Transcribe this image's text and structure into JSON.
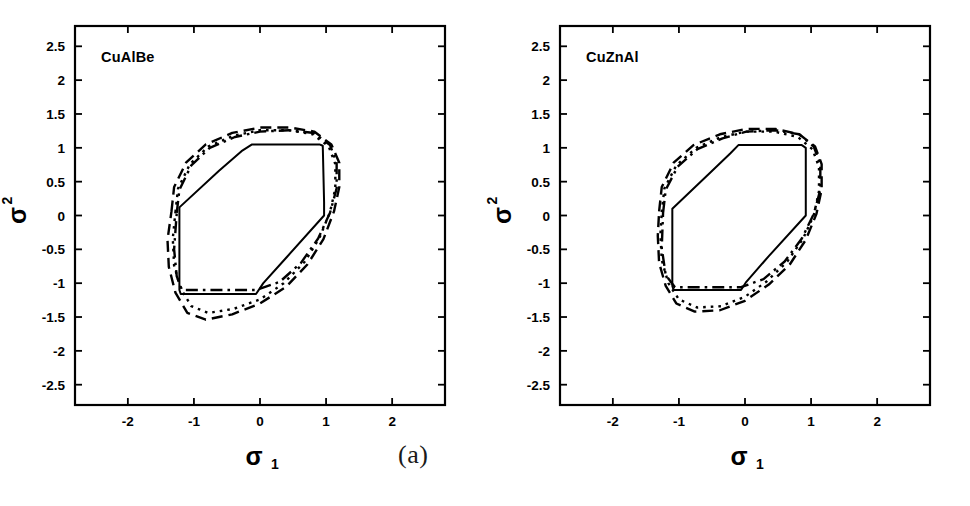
{
  "figure": {
    "panels": [
      {
        "caption": "(a)",
        "material_label": "CuAlBe",
        "xlabel_symbol": "σ",
        "xlabel_sub": "1",
        "ylabel_symbol": "σ",
        "ylabel_sub": "2"
      },
      {
        "caption": "(b)",
        "material_label": "CuZnAl",
        "xlabel_symbol": "σ",
        "xlabel_sub": "1",
        "ylabel_symbol": "σ",
        "ylabel_sub": "2"
      }
    ]
  },
  "chart_data": [
    {
      "type": "line",
      "title": "CuAlBe",
      "panel": "(a)",
      "xlabel": "σ1",
      "ylabel": "σ2",
      "xlim": [
        -2.8,
        2.8
      ],
      "ylim": [
        -2.8,
        2.8
      ],
      "xticks": [
        -2,
        -1,
        0,
        1,
        2
      ],
      "xticklabels": [
        "-2",
        "-1",
        "0",
        "1",
        "2"
      ],
      "yticks": [
        -2.5,
        -2,
        -1.5,
        -1,
        -0.5,
        0,
        0.5,
        1,
        1.5,
        2,
        2.5
      ],
      "yticklabels": [
        "-2.5",
        "-2",
        "-1.5",
        "-1",
        "-0.5",
        "0",
        "0.5",
        "1",
        "1.5",
        "2",
        "2.5"
      ],
      "grid": false,
      "legend": "none",
      "series": [
        {
          "name": "solid-yield-surface",
          "style": "solid",
          "closed": true,
          "points": [
            [
              -1.22,
              0.0
            ],
            [
              -1.22,
              0.12
            ],
            [
              -0.62,
              0.66
            ],
            [
              -0.28,
              0.95
            ],
            [
              -0.12,
              1.05
            ],
            [
              0.9,
              1.05
            ],
            [
              0.95,
              1.03
            ],
            [
              0.97,
              0.2
            ],
            [
              0.97,
              0.0
            ],
            [
              0.4,
              -0.62
            ],
            [
              0.05,
              -1.0
            ],
            [
              -0.06,
              -1.16
            ],
            [
              -1.2,
              -1.16
            ],
            [
              -1.22,
              -1.1
            ],
            [
              -1.22,
              0.0
            ]
          ]
        },
        {
          "name": "dashed-yield-surface",
          "style": "dashed",
          "closed": true,
          "points": [
            [
              -1.34,
              0.06
            ],
            [
              -1.3,
              0.42
            ],
            [
              -1.12,
              0.78
            ],
            [
              -0.82,
              1.05
            ],
            [
              -0.42,
              1.22
            ],
            [
              0.0,
              1.3
            ],
            [
              0.45,
              1.3
            ],
            [
              0.82,
              1.24
            ],
            [
              1.08,
              1.05
            ],
            [
              1.2,
              0.78
            ],
            [
              1.2,
              0.42
            ],
            [
              1.12,
              0.06
            ],
            [
              0.96,
              -0.35
            ],
            [
              0.72,
              -0.72
            ],
            [
              0.4,
              -1.05
            ],
            [
              0.0,
              -1.3
            ],
            [
              -0.42,
              -1.46
            ],
            [
              -0.82,
              -1.54
            ],
            [
              -1.1,
              -1.44
            ],
            [
              -1.28,
              -1.14
            ],
            [
              -1.38,
              -0.76
            ],
            [
              -1.4,
              -0.36
            ],
            [
              -1.34,
              0.06
            ]
          ]
        },
        {
          "name": "dotted-yield-surface",
          "style": "dotted",
          "closed": true,
          "points": [
            [
              -1.28,
              0.05
            ],
            [
              -1.24,
              0.4
            ],
            [
              -1.06,
              0.76
            ],
            [
              -0.78,
              1.02
            ],
            [
              -0.4,
              1.18
            ],
            [
              0.0,
              1.26
            ],
            [
              0.44,
              1.26
            ],
            [
              0.8,
              1.2
            ],
            [
              1.04,
              1.02
            ],
            [
              1.14,
              0.76
            ],
            [
              1.14,
              0.4
            ],
            [
              1.06,
              0.05
            ],
            [
              0.9,
              -0.33
            ],
            [
              0.68,
              -0.68
            ],
            [
              0.36,
              -1.0
            ],
            [
              0.0,
              -1.24
            ],
            [
              -0.4,
              -1.38
            ],
            [
              -0.78,
              -1.44
            ],
            [
              -1.04,
              -1.34
            ],
            [
              -1.2,
              -1.08
            ],
            [
              -1.3,
              -0.74
            ],
            [
              -1.32,
              -0.34
            ],
            [
              -1.28,
              0.05
            ]
          ]
        },
        {
          "name": "dashdot-yield-surface",
          "style": "dashdot",
          "closed": true,
          "points": [
            [
              -1.26,
              0.04
            ],
            [
              -1.22,
              0.38
            ],
            [
              -1.04,
              0.74
            ],
            [
              -0.76,
              1.0
            ],
            [
              -0.38,
              1.16
            ],
            [
              0.0,
              1.24
            ],
            [
              0.44,
              1.26
            ],
            [
              0.82,
              1.22
            ],
            [
              1.06,
              1.04
            ],
            [
              1.16,
              0.78
            ],
            [
              1.16,
              0.4
            ],
            [
              1.06,
              0.04
            ],
            [
              0.88,
              -0.34
            ],
            [
              0.62,
              -0.7
            ],
            [
              0.3,
              -0.98
            ],
            [
              -0.06,
              -1.1
            ],
            [
              -1.18,
              -1.1
            ],
            [
              -1.26,
              -0.9
            ],
            [
              -1.3,
              -0.5
            ],
            [
              -1.26,
              0.04
            ]
          ]
        }
      ]
    },
    {
      "type": "line",
      "title": "CuZnAl",
      "panel": "(b)",
      "xlabel": "σ1",
      "ylabel": "σ2",
      "xlim": [
        -2.8,
        2.8
      ],
      "ylim": [
        -2.8,
        2.8
      ],
      "xticks": [
        -2,
        -1,
        0,
        1,
        2
      ],
      "xticklabels": [
        "-2",
        "-1",
        "0",
        "1",
        "2"
      ],
      "yticks": [
        -2.5,
        -2,
        -1.5,
        -1,
        -0.5,
        0,
        0.5,
        1,
        1.5,
        2,
        2.5
      ],
      "yticklabels": [
        "-2.5",
        "-2",
        "-1.5",
        "-1",
        "-0.5",
        "0",
        "0.5",
        "1",
        "1.5",
        "2",
        "2.5"
      ],
      "grid": false,
      "legend": "none",
      "series": [
        {
          "name": "solid-yield-surface",
          "style": "solid",
          "closed": true,
          "points": [
            [
              -1.1,
              0.0
            ],
            [
              -1.1,
              0.1
            ],
            [
              -0.54,
              0.62
            ],
            [
              -0.22,
              0.92
            ],
            [
              -0.1,
              1.04
            ],
            [
              0.86,
              1.04
            ],
            [
              0.92,
              1.0
            ],
            [
              0.92,
              0.18
            ],
            [
              0.92,
              0.0
            ],
            [
              0.36,
              -0.6
            ],
            [
              0.02,
              -0.98
            ],
            [
              -0.06,
              -1.1
            ],
            [
              -1.08,
              -1.1
            ],
            [
              -1.1,
              -1.04
            ],
            [
              -1.1,
              0.0
            ]
          ]
        },
        {
          "name": "dashed-yield-surface",
          "style": "dashed",
          "closed": true,
          "points": [
            [
              -1.3,
              0.06
            ],
            [
              -1.26,
              0.42
            ],
            [
              -1.08,
              0.78
            ],
            [
              -0.78,
              1.04
            ],
            [
              -0.38,
              1.2
            ],
            [
              0.02,
              1.28
            ],
            [
              0.46,
              1.28
            ],
            [
              0.82,
              1.2
            ],
            [
              1.06,
              1.02
            ],
            [
              1.16,
              0.76
            ],
            [
              1.16,
              0.38
            ],
            [
              1.08,
              0.02
            ],
            [
              0.92,
              -0.36
            ],
            [
              0.68,
              -0.72
            ],
            [
              0.36,
              -1.02
            ],
            [
              0.0,
              -1.26
            ],
            [
              -0.38,
              -1.4
            ],
            [
              -0.76,
              -1.42
            ],
            [
              -1.04,
              -1.3
            ],
            [
              -1.2,
              -1.04
            ],
            [
              -1.3,
              -0.7
            ],
            [
              -1.32,
              -0.3
            ],
            [
              -1.3,
              0.06
            ]
          ]
        },
        {
          "name": "dotted-yield-surface",
          "style": "dotted",
          "closed": true,
          "points": [
            [
              -1.26,
              0.05
            ],
            [
              -1.22,
              0.4
            ],
            [
              -1.04,
              0.74
            ],
            [
              -0.74,
              1.0
            ],
            [
              -0.36,
              1.16
            ],
            [
              0.02,
              1.24
            ],
            [
              0.44,
              1.24
            ],
            [
              0.8,
              1.16
            ],
            [
              1.02,
              0.98
            ],
            [
              1.12,
              0.72
            ],
            [
              1.12,
              0.36
            ],
            [
              1.04,
              0.0
            ],
            [
              0.88,
              -0.34
            ],
            [
              0.64,
              -0.68
            ],
            [
              0.32,
              -0.98
            ],
            [
              0.0,
              -1.2
            ],
            [
              -0.36,
              -1.34
            ],
            [
              -0.72,
              -1.36
            ],
            [
              -1.0,
              -1.24
            ],
            [
              -1.16,
              -1.0
            ],
            [
              -1.26,
              -0.66
            ],
            [
              -1.28,
              -0.28
            ],
            [
              -1.26,
              0.05
            ]
          ]
        },
        {
          "name": "dashdot-yield-surface",
          "style": "dashdot",
          "closed": true,
          "points": [
            [
              -1.24,
              0.04
            ],
            [
              -1.2,
              0.38
            ],
            [
              -1.02,
              0.72
            ],
            [
              -0.72,
              0.98
            ],
            [
              -0.34,
              1.14
            ],
            [
              0.02,
              1.24
            ],
            [
              0.46,
              1.26
            ],
            [
              0.82,
              1.2
            ],
            [
              1.04,
              1.02
            ],
            [
              1.14,
              0.76
            ],
            [
              1.14,
              0.38
            ],
            [
              1.04,
              0.02
            ],
            [
              0.86,
              -0.34
            ],
            [
              0.6,
              -0.68
            ],
            [
              0.28,
              -0.94
            ],
            [
              -0.06,
              -1.06
            ],
            [
              -1.06,
              -1.06
            ],
            [
              -1.2,
              -0.88
            ],
            [
              -1.26,
              -0.48
            ],
            [
              -1.24,
              0.04
            ]
          ]
        }
      ]
    }
  ]
}
